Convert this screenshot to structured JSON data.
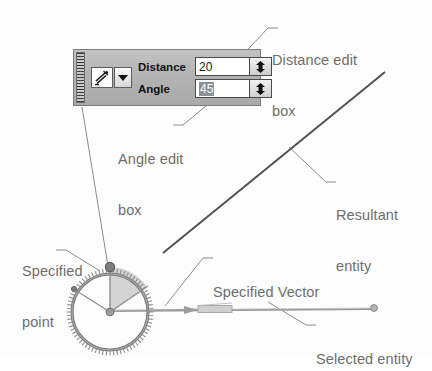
{
  "figure": {
    "background_color": "#fdfdfd",
    "label_color": "#6e6e6e"
  },
  "toolbar": {
    "name": "dynamic-input-toolbar",
    "grip_name": "drag-grip",
    "mode_button_icon": "snap-vector-icon",
    "mode_dropdown_icon": "chevron-down-icon",
    "background_color": "#b4b4b4",
    "border_color": "#7b7b7b",
    "fields": [
      {
        "label": "Distance",
        "value": "20",
        "placeholder": "0",
        "selected": false,
        "spinner_icon": "spinner-up-down-icon"
      },
      {
        "label": "Angle",
        "value": "45",
        "placeholder": "0",
        "selected": true,
        "spinner_icon": "spinner-up-down-icon"
      }
    ]
  },
  "callouts": [
    {
      "id": "distance-edit-box",
      "line1": "Distance edit",
      "line2": "box",
      "x": 272,
      "y": 18
    },
    {
      "id": "angle-edit-box",
      "line1": "Angle edit",
      "line2": "box",
      "x": 118,
      "y": 117
    },
    {
      "id": "resultant-entity",
      "line1": "Resultant",
      "line2": "entity",
      "x": 330,
      "y": 173
    },
    {
      "id": "specified-point",
      "line1": "Specified",
      "line2": "point",
      "x": 22,
      "y": 229
    },
    {
      "id": "specified-vector",
      "line1": "Specified Vector",
      "line2": "",
      "x": 207,
      "y": 250
    },
    {
      "id": "selected-entity",
      "line1": "Selected entity",
      "line2": "",
      "x": 310,
      "y": 318
    }
  ],
  "graphics": {
    "protractor": {
      "center_x": 110,
      "center_y": 312,
      "radius": 38,
      "tick_count": 72,
      "ring_color": "#8a8a8a",
      "angle_start_deg": 112,
      "angle_end_deg": 68,
      "sector_fill": "#c8c8c8"
    },
    "resultant_line": {
      "from_x": 163,
      "from_y": 253,
      "to_x": 385,
      "to_y": 72,
      "color": "#555555"
    },
    "selected_entity_line": {
      "from_x": 110,
      "from_y": 312,
      "to_x": 375,
      "to_y": 309,
      "color": "#8d8d8d"
    },
    "specified_point_marker": {
      "x": 110,
      "y": 267,
      "color": "#6f6f6f"
    }
  }
}
